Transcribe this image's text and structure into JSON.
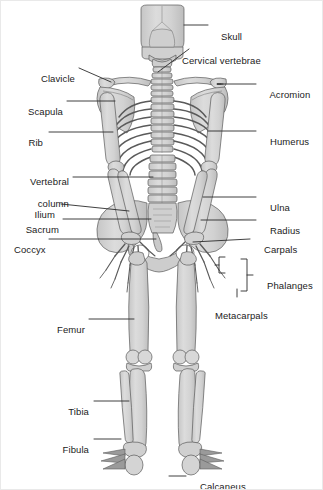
{
  "figure": {
    "view": "posterior",
    "background_color": "#ffffff",
    "bone_fill_color": "#d7d7d7",
    "bone_shade_color": "#c2c2c2",
    "bone_outline_color": "#5a5a5a",
    "leader_line_color": "#2b2b2b",
    "label_text_color": "#1b1b1b"
  },
  "labels": {
    "skull": "Skull",
    "cervical_vertebrae": "Cervical vertebrae",
    "clavicle": "Clavicle",
    "acromion": "Acromion",
    "scapula": "Scapula",
    "rib": "Rib",
    "humerus": "Humerus",
    "vertebral_column_line1": "Vertebral",
    "vertebral_column_line2": "column",
    "ilium": "Ilium",
    "ulna": "Ulna",
    "sacrum": "Sacrum",
    "radius": "Radius",
    "coccyx": "Coccyx",
    "carpals": "Carpals",
    "phalanges": "Phalanges",
    "metacarpals": "Metacarpals",
    "femur": "Femur",
    "tibia": "Tibia",
    "fibula": "Fibula",
    "calcaneus": "Calcaneus"
  },
  "label_list": [
    {
      "id": "skull",
      "text": "Skull",
      "side": "right"
    },
    {
      "id": "cervical-vertebrae",
      "text": "Cervical vertebrae",
      "side": "right"
    },
    {
      "id": "clavicle",
      "text": "Clavicle",
      "side": "left"
    },
    {
      "id": "acromion",
      "text": "Acromion",
      "side": "right"
    },
    {
      "id": "scapula",
      "text": "Scapula",
      "side": "left"
    },
    {
      "id": "rib",
      "text": "Rib",
      "side": "left"
    },
    {
      "id": "humerus",
      "text": "Humerus",
      "side": "right"
    },
    {
      "id": "vertebral-column",
      "text": "Vertebral column",
      "side": "left"
    },
    {
      "id": "ilium",
      "text": "Ilium",
      "side": "left"
    },
    {
      "id": "ulna",
      "text": "Ulna",
      "side": "right"
    },
    {
      "id": "sacrum",
      "text": "Sacrum",
      "side": "left"
    },
    {
      "id": "radius",
      "text": "Radius",
      "side": "right"
    },
    {
      "id": "coccyx",
      "text": "Coccyx",
      "side": "left"
    },
    {
      "id": "carpals",
      "text": "Carpals",
      "side": "right"
    },
    {
      "id": "phalanges",
      "text": "Phalanges",
      "side": "right"
    },
    {
      "id": "metacarpals",
      "text": "Metacarpals",
      "side": "right"
    },
    {
      "id": "femur",
      "text": "Femur",
      "side": "left"
    },
    {
      "id": "tibia",
      "text": "Tibia",
      "side": "left"
    },
    {
      "id": "fibula",
      "text": "Fibula",
      "side": "left"
    },
    {
      "id": "calcaneus",
      "text": "Calcaneus",
      "side": "right"
    }
  ]
}
